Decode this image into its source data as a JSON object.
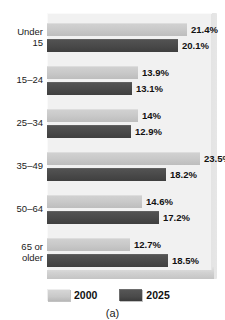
{
  "title_strip": {
    "clipped_text": ""
  },
  "caption": "(a)",
  "legend": {
    "position": "bottom-left",
    "items": [
      {
        "label": "2000",
        "color": "#c8c8c8"
      },
      {
        "label": "2025",
        "color": "#4a4a4a"
      }
    ]
  },
  "colors": {
    "series_2000": "#c8c8c8",
    "series_2025": "#4a4a4a",
    "plot_background": "#f1f1f1",
    "panel_shadow": "#cfcfcf",
    "text": "#111111"
  },
  "chart_data": {
    "type": "bar",
    "orientation": "horizontal",
    "grouped": true,
    "title": "",
    "xlabel": "",
    "ylabel": "",
    "grid": false,
    "legend_position": "bottom-left",
    "xlim": [
      0,
      25
    ],
    "categories": [
      "Under 15",
      "15–24",
      "25–34",
      "35–49",
      "50–64",
      "65 or older"
    ],
    "category_lines": [
      [
        "Under",
        "15"
      ],
      [
        "15–24"
      ],
      [
        "25–34"
      ],
      [
        "35–49"
      ],
      [
        "50–64"
      ],
      [
        "65 or",
        "older"
      ]
    ],
    "series": [
      {
        "name": "2000",
        "values": [
          21.4,
          13.9,
          14,
          23.5,
          14.6,
          12.7
        ],
        "labels": [
          "21.4%",
          "13.9%",
          "14%",
          "23.5%",
          "14.6%",
          "12.7%"
        ]
      },
      {
        "name": "2025",
        "values": [
          20.1,
          13.1,
          12.9,
          18.2,
          17.2,
          18.5
        ],
        "labels": [
          "20.1%",
          "13.1%",
          "12.9%",
          "18.2%",
          "17.2%",
          "18.5%"
        ]
      }
    ]
  }
}
